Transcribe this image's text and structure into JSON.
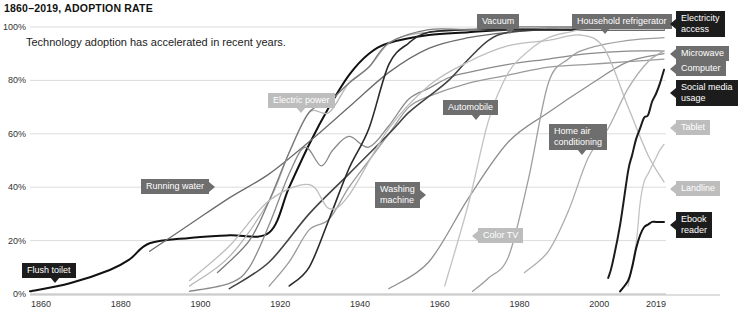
{
  "chart_data": {
    "type": "line",
    "title": "1860–2019, ADOPTION RATE",
    "subtitle": "Technology adoption has accelerated in recent years.",
    "xlabel": "",
    "ylabel": "",
    "xlim": [
      1860,
      2019
    ],
    "ylim": [
      0,
      100
    ],
    "grid": true,
    "legend_position": "inline-labels",
    "x_ticks": [
      "1860",
      "1880",
      "1900",
      "1920",
      "1940",
      "1960",
      "1980",
      "2000",
      "2019"
    ],
    "x_tick_values": [
      1860,
      1880,
      1900,
      1920,
      1940,
      1960,
      1980,
      2000,
      2019
    ],
    "y_ticks": [
      "0%",
      "20%",
      "40%",
      "60%",
      "80%",
      "100%"
    ],
    "y_tick_values": [
      0,
      20,
      40,
      60,
      80,
      100
    ],
    "series": [
      {
        "name": "Flush toilet",
        "color": "#111111",
        "width": 2.0,
        "points": [
          [
            1860,
            1
          ],
          [
            1870,
            4
          ],
          [
            1880,
            9
          ],
          [
            1885,
            13
          ],
          [
            1890,
            19
          ],
          [
            1900,
            21
          ],
          [
            1910,
            22
          ],
          [
            1920,
            23
          ],
          [
            1925,
            40
          ],
          [
            1930,
            56
          ],
          [
            1935,
            70
          ],
          [
            1940,
            82
          ],
          [
            1945,
            90
          ],
          [
            1950,
            94
          ],
          [
            1960,
            97
          ],
          [
            1970,
            98
          ],
          [
            1980,
            99
          ],
          [
            1990,
            99
          ],
          [
            2000,
            99
          ],
          [
            2019,
            99
          ]
        ]
      },
      {
        "name": "Running water",
        "color": "#6b6b6b",
        "width": 1.3,
        "points": [
          [
            1890,
            16
          ],
          [
            1900,
            26
          ],
          [
            1910,
            36
          ],
          [
            1920,
            45
          ],
          [
            1930,
            57
          ],
          [
            1940,
            70
          ],
          [
            1950,
            83
          ],
          [
            1960,
            92
          ],
          [
            1970,
            96
          ],
          [
            1980,
            98
          ],
          [
            1990,
            99
          ],
          [
            2000,
            99
          ],
          [
            2019,
            99
          ]
        ]
      },
      {
        "name": "Electric power",
        "color": "#b5b5b5",
        "width": 1.3,
        "points": [
          [
            1900,
            3
          ],
          [
            1910,
            14
          ],
          [
            1920,
            35
          ],
          [
            1925,
            53
          ],
          [
            1930,
            68
          ],
          [
            1935,
            68
          ],
          [
            1940,
            79
          ],
          [
            1945,
            85
          ],
          [
            1950,
            94
          ],
          [
            1955,
            97
          ],
          [
            1960,
            98
          ],
          [
            1970,
            99
          ],
          [
            1980,
            99
          ],
          [
            1990,
            99
          ],
          [
            2000,
            100
          ],
          [
            2019,
            100
          ]
        ]
      },
      {
        "name": "Automobile",
        "color": "#8a8a8a",
        "width": 1.3,
        "points": [
          [
            1900,
            1
          ],
          [
            1910,
            4
          ],
          [
            1915,
            10
          ],
          [
            1920,
            26
          ],
          [
            1925,
            45
          ],
          [
            1929,
            55
          ],
          [
            1933,
            48
          ],
          [
            1936,
            54
          ],
          [
            1940,
            59
          ],
          [
            1945,
            55
          ],
          [
            1950,
            63
          ],
          [
            1955,
            73
          ],
          [
            1960,
            77
          ],
          [
            1965,
            81
          ],
          [
            1970,
            83
          ],
          [
            1980,
            86
          ],
          [
            1990,
            88
          ],
          [
            2000,
            90
          ],
          [
            2010,
            91
          ],
          [
            2019,
            91
          ]
        ]
      },
      {
        "name": "Washing machine",
        "color": "#9a9a9a",
        "width": 1.3,
        "points": [
          [
            1920,
            3
          ],
          [
            1925,
            12
          ],
          [
            1930,
            24
          ],
          [
            1935,
            28
          ],
          [
            1940,
            40
          ],
          [
            1945,
            50
          ],
          [
            1950,
            60
          ],
          [
            1955,
            70
          ],
          [
            1960,
            74
          ],
          [
            1970,
            79
          ],
          [
            1980,
            82
          ],
          [
            1990,
            85
          ],
          [
            2000,
            86
          ],
          [
            2010,
            87
          ],
          [
            2019,
            88
          ]
        ]
      },
      {
        "name": "Vacuum",
        "color": "#444444",
        "width": 1.6,
        "points": [
          [
            1910,
            2
          ],
          [
            1920,
            12
          ],
          [
            1930,
            30
          ],
          [
            1940,
            45
          ],
          [
            1950,
            60
          ],
          [
            1955,
            68
          ],
          [
            1960,
            74
          ],
          [
            1965,
            80
          ],
          [
            1970,
            88
          ],
          [
            1975,
            95
          ],
          [
            1980,
            98
          ],
          [
            1990,
            99
          ],
          [
            2000,
            99
          ],
          [
            2019,
            99
          ]
        ]
      },
      {
        "name": "Household refrigerator",
        "color": "#2a2a2a",
        "width": 1.6,
        "points": [
          [
            1925,
            3
          ],
          [
            1930,
            10
          ],
          [
            1935,
            28
          ],
          [
            1940,
            47
          ],
          [
            1945,
            62
          ],
          [
            1950,
            86
          ],
          [
            1955,
            94
          ],
          [
            1960,
            98
          ],
          [
            1970,
            99
          ],
          [
            1980,
            99
          ],
          [
            1990,
            99
          ],
          [
            2000,
            99
          ],
          [
            2019,
            100
          ]
        ]
      },
      {
        "name": "Electricity access",
        "color": "#7a7a7a",
        "width": 1.3,
        "points": [
          [
            1907,
            8
          ],
          [
            1915,
            20
          ],
          [
            1920,
            35
          ],
          [
            1925,
            53
          ],
          [
            1930,
            68
          ],
          [
            1935,
            72
          ],
          [
            1940,
            79
          ],
          [
            1945,
            85
          ],
          [
            1950,
            94
          ],
          [
            1960,
            99
          ],
          [
            1970,
            99
          ],
          [
            1980,
            100
          ],
          [
            1990,
            100
          ],
          [
            2000,
            100
          ],
          [
            2019,
            100
          ]
        ]
      },
      {
        "name": "Home air conditioning",
        "color": "#8f8f8f",
        "width": 1.3,
        "points": [
          [
            1950,
            2
          ],
          [
            1960,
            12
          ],
          [
            1970,
            36
          ],
          [
            1980,
            57
          ],
          [
            1990,
            68
          ],
          [
            2000,
            78
          ],
          [
            2010,
            87
          ],
          [
            2019,
            90
          ]
        ]
      },
      {
        "name": "Color TV",
        "color": "#c3c3c3",
        "width": 1.3,
        "points": [
          [
            1964,
            3
          ],
          [
            1970,
            34
          ],
          [
            1975,
            65
          ],
          [
            1980,
            83
          ],
          [
            1985,
            91
          ],
          [
            1990,
            96
          ],
          [
            1995,
            98
          ],
          [
            2000,
            99
          ],
          [
            2019,
            99
          ]
        ]
      },
      {
        "name": "Microwave",
        "color": "#9e9e9e",
        "width": 1.3,
        "points": [
          [
            1971,
            1
          ],
          [
            1975,
            6
          ],
          [
            1980,
            14
          ],
          [
            1985,
            43
          ],
          [
            1990,
            79
          ],
          [
            1995,
            88
          ],
          [
            2000,
            92
          ],
          [
            2010,
            95
          ],
          [
            2019,
            96
          ]
        ]
      },
      {
        "name": "Computer",
        "color": "#adadad",
        "width": 1.3,
        "points": [
          [
            1984,
            8
          ],
          [
            1990,
            16
          ],
          [
            1995,
            31
          ],
          [
            2000,
            51
          ],
          [
            2005,
            62
          ],
          [
            2010,
            77
          ],
          [
            2015,
            87
          ],
          [
            2019,
            91
          ]
        ]
      },
      {
        "name": "Landline",
        "color": "#bdbdbd",
        "width": 1.3,
        "points": [
          [
            1900,
            5
          ],
          [
            1910,
            18
          ],
          [
            1920,
            35
          ],
          [
            1930,
            41
          ],
          [
            1935,
            32
          ],
          [
            1940,
            37
          ],
          [
            1950,
            62
          ],
          [
            1960,
            78
          ],
          [
            1970,
            87
          ],
          [
            1980,
            93
          ],
          [
            1990,
            95
          ],
          [
            1998,
            97
          ],
          [
            2004,
            92
          ],
          [
            2010,
            70
          ],
          [
            2015,
            52
          ],
          [
            2019,
            42
          ]
        ]
      },
      {
        "name": "Social media usage",
        "color": "#1c1c1c",
        "width": 2.0,
        "points": [
          [
            2005,
            6
          ],
          [
            2006,
            11
          ],
          [
            2008,
            26
          ],
          [
            2010,
            46
          ],
          [
            2011,
            52
          ],
          [
            2012,
            58
          ],
          [
            2013,
            62
          ],
          [
            2014,
            66
          ],
          [
            2015,
            67
          ],
          [
            2016,
            72
          ],
          [
            2017,
            75
          ],
          [
            2018,
            79
          ],
          [
            2019,
            84
          ]
        ]
      },
      {
        "name": "Tablet",
        "color": "#c3c3c3",
        "width": 1.3,
        "points": [
          [
            2010,
            3
          ],
          [
            2012,
            19
          ],
          [
            2013,
            34
          ],
          [
            2014,
            42
          ],
          [
            2015,
            45
          ],
          [
            2016,
            48
          ],
          [
            2017,
            51
          ],
          [
            2018,
            54
          ],
          [
            2019,
            56
          ]
        ]
      },
      {
        "name": "Ebook reader",
        "color": "#141414",
        "width": 2.0,
        "points": [
          [
            2008,
            1
          ],
          [
            2010,
            5
          ],
          [
            2011,
            10
          ],
          [
            2012,
            17
          ],
          [
            2013,
            22
          ],
          [
            2014,
            25
          ],
          [
            2015,
            26
          ],
          [
            2016,
            27
          ],
          [
            2017,
            27
          ],
          [
            2019,
            27
          ]
        ]
      }
    ],
    "annotations": [
      {
        "id": "flush-toilet",
        "text": "Flush toilet",
        "style": "dark",
        "tip": "down",
        "x": 22,
        "y": 263
      },
      {
        "id": "running-water",
        "text": "Running water",
        "style": "mid",
        "tip": "right",
        "x": 141,
        "y": 179
      },
      {
        "id": "electric-power",
        "text": "Electric power",
        "style": "light",
        "tip": "down",
        "x": 268,
        "y": 93
      },
      {
        "id": "automobile",
        "text": "Automobile",
        "style": "mid",
        "tip": "down",
        "x": 443,
        "y": 100
      },
      {
        "id": "washing-machine",
        "text": "Washing\nmachine",
        "style": "mid",
        "tip": "right",
        "x": 375,
        "y": 182
      },
      {
        "id": "vacuum",
        "text": "Vacuum",
        "style": "mid",
        "tip": "down",
        "x": 477,
        "y": 14
      },
      {
        "id": "household-refrigerator",
        "text": "Household refrigerator",
        "style": "mid",
        "tip": "down",
        "x": 572,
        "y": 14
      },
      {
        "id": "home-air-conditioning",
        "text": "Home air\nconditioning",
        "style": "mid",
        "tip": "down",
        "x": 549,
        "y": 124
      },
      {
        "id": "color-tv",
        "text": "Color TV",
        "style": "light",
        "tip": "left",
        "x": 478,
        "y": 228
      },
      {
        "id": "electricity-access",
        "text": "Electricity\naccess",
        "style": "dark",
        "tip": "left",
        "x": 676,
        "y": 11
      },
      {
        "id": "microwave",
        "text": "Microwave",
        "style": "mid",
        "tip": "left",
        "x": 676,
        "y": 46
      },
      {
        "id": "computer",
        "text": "Computer",
        "style": "mid",
        "tip": "left",
        "x": 676,
        "y": 61
      },
      {
        "id": "social-media-usage",
        "text": "Social media\nusage",
        "style": "dark",
        "tip": "left",
        "x": 676,
        "y": 80
      },
      {
        "id": "tablet",
        "text": "Tablet",
        "style": "light",
        "tip": "left",
        "x": 676,
        "y": 120
      },
      {
        "id": "landline",
        "text": "Landline",
        "style": "light",
        "tip": "left",
        "x": 676,
        "y": 181
      },
      {
        "id": "ebook-reader",
        "text": "Ebook\nreader",
        "style": "dark",
        "tip": "left",
        "x": 676,
        "y": 212
      }
    ]
  }
}
